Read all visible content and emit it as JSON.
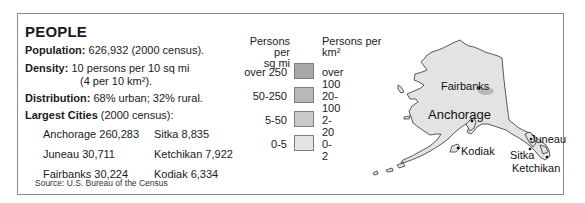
{
  "panel": {
    "title": "PEOPLE",
    "population": {
      "label": "Population:",
      "value": "626,932 (2000 census)."
    },
    "density": {
      "label": "Density:",
      "value_line1": "10 persons per 10 sq mi",
      "value_line2": "(4 per 10 km²)."
    },
    "distribution": {
      "label": "Distribution:",
      "value": "68% urban; 32% rural."
    },
    "largest_cities": {
      "label": "Largest Cities",
      "note": "(2000 census):",
      "items": [
        {
          "text": "Anchorage 260,283"
        },
        {
          "text": "Sitka 8,835"
        },
        {
          "text": "Juneau 30,711"
        },
        {
          "text": "Ketchikan 7,922"
        },
        {
          "text": "Fairbanks 30,224"
        },
        {
          "text": "Kodiak 6,334"
        }
      ]
    },
    "source": "Source: U.S. Bureau of the Census"
  },
  "legend": {
    "left_header_line1": "Persons per",
    "left_header_line2": "sq mi",
    "right_header_line1": "Persons per",
    "right_header_line2": "km²",
    "rows": [
      {
        "sq_mi": "over 250",
        "km2": "over 100",
        "color": "#a9a9a9"
      },
      {
        "sq_mi": "50-250",
        "km2": "20-100",
        "color": "#b8b8b8"
      },
      {
        "sq_mi": "5-50",
        "km2": "2-20",
        "color": "#c9c9c9"
      },
      {
        "sq_mi": "0-5",
        "km2": "0-2",
        "color": "#e3e3e3"
      }
    ]
  },
  "map": {
    "region": "Alaska",
    "fill_color": "#e3e3e3",
    "labels": {
      "fairbanks": "Fairbanks",
      "anchorage": "Anchorage",
      "juneau": "Juneau",
      "kodiak": "Kodiak",
      "sitka": "Sitka",
      "ketchikan": "Ketchikan"
    }
  }
}
